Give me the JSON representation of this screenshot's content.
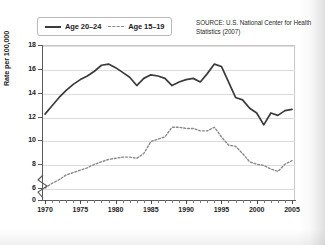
{
  "legend": {
    "entries": [
      {
        "label": "Age 20–24",
        "style": "solid",
        "color": "#3b3b3b"
      },
      {
        "label": "Age 15–19",
        "style": "dashed",
        "color": "#8a8a8a"
      }
    ]
  },
  "source": {
    "text": "SOURCE: U.S. National Center for Health Statistics (2007)"
  },
  "chart_data": {
    "type": "line",
    "title": "",
    "xlabel": "",
    "ylabel": "Rate per 100,000",
    "xlim": [
      1970,
      2005
    ],
    "ylim": [
      5,
      18
    ],
    "y_axis_break": true,
    "y_axis_break_note": "axis broken between 0 and 6",
    "yticks": [
      0,
      6,
      8,
      10,
      12,
      14,
      16,
      18
    ],
    "ytick_labels": [
      "0",
      "6",
      "8",
      "10",
      "12",
      "14",
      "16",
      "18"
    ],
    "xticks": [
      1970,
      1975,
      1980,
      1985,
      1990,
      1995,
      2000,
      2005
    ],
    "xtick_labels": [
      "1970",
      "1975",
      "1980",
      "1985",
      "1990",
      "1995",
      "2000",
      "2005"
    ],
    "x_minor_tick_step": 1,
    "grid": true,
    "grid_axis": "y",
    "legend_position": "top-left",
    "x": [
      1970,
      1971,
      1972,
      1973,
      1974,
      1975,
      1976,
      1977,
      1978,
      1979,
      1980,
      1981,
      1982,
      1983,
      1984,
      1985,
      1986,
      1987,
      1988,
      1989,
      1990,
      1991,
      1992,
      1993,
      1994,
      1995,
      1996,
      1997,
      1998,
      1999,
      2000,
      2001,
      2002,
      2003,
      2004,
      2005
    ],
    "series": [
      {
        "name": "Age 20–24",
        "style": "solid",
        "color": "#3b3b3b",
        "values": [
          12.2,
          12.9,
          13.6,
          14.2,
          14.7,
          15.1,
          15.4,
          15.8,
          16.3,
          16.4,
          16.1,
          15.7,
          15.3,
          14.6,
          15.2,
          15.5,
          15.4,
          15.2,
          14.6,
          14.9,
          15.1,
          15.2,
          14.9,
          15.6,
          16.4,
          16.2,
          14.9,
          13.6,
          13.4,
          12.7,
          12.3,
          11.3,
          12.3,
          12.1,
          12.5,
          12.6
        ]
      },
      {
        "name": "Age 15–19",
        "style": "dashed",
        "color": "#8a8a8a",
        "values": [
          6.0,
          6.4,
          6.7,
          7.1,
          7.3,
          7.5,
          7.7,
          8.0,
          8.2,
          8.4,
          8.5,
          8.6,
          8.6,
          8.5,
          8.9,
          9.9,
          10.1,
          10.3,
          11.1,
          11.1,
          11.0,
          11.0,
          10.8,
          10.8,
          11.1,
          10.3,
          9.6,
          9.5,
          8.9,
          8.2,
          8.0,
          7.9,
          7.6,
          7.4,
          8.0,
          8.3
        ]
      }
    ]
  }
}
